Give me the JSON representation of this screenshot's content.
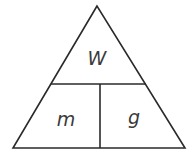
{
  "diagram": {
    "type": "formula-triangle",
    "top": {
      "label": "W"
    },
    "bottom_left": {
      "label": "m"
    },
    "bottom_right": {
      "label": "g"
    }
  }
}
